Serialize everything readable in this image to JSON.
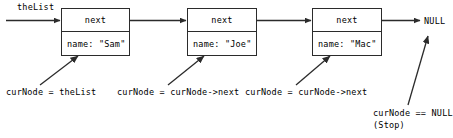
{
  "diagram": {
    "title_label": "theList",
    "null_label": "NULL",
    "nodes": [
      {
        "next_label": "next",
        "name_label": "name: \"Sam\""
      },
      {
        "next_label": "next",
        "name_label": "name: \"Joe\""
      },
      {
        "next_label": "next",
        "name_label": "name: \"Mac\""
      }
    ],
    "annotations": [
      {
        "text": "curNode = theList"
      },
      {
        "text": "curNode = curNode->next"
      },
      {
        "text": "curNode = curNode->next"
      }
    ],
    "stop_annotation": {
      "line1": "curNode == NULL",
      "line2": "(Stop)"
    },
    "colors": {
      "stroke": "#2b2b2b",
      "text": "#000000",
      "background": "#ffffff"
    }
  }
}
